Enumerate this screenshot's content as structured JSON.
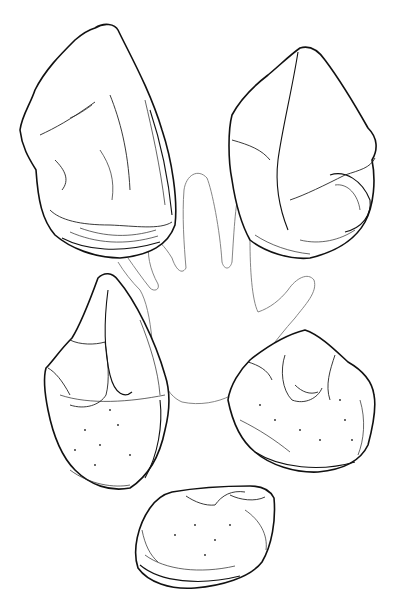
{
  "illustration": {
    "description": "Line drawing of five stone tools (pebble/chopper artifacts) arranged around a faint outline of a human hand",
    "colors": {
      "background": "#ffffff",
      "ink": "#111111",
      "hand_outline": "#777777"
    },
    "objects": [
      {
        "id": "stone-top-left",
        "kind": "stone tool"
      },
      {
        "id": "stone-top-right",
        "kind": "stone tool"
      },
      {
        "id": "stone-middle-left",
        "kind": "stone tool"
      },
      {
        "id": "stone-middle-right",
        "kind": "stone tool"
      },
      {
        "id": "stone-bottom",
        "kind": "stone tool"
      },
      {
        "id": "hand-outline",
        "kind": "hand silhouette for scale"
      }
    ]
  }
}
